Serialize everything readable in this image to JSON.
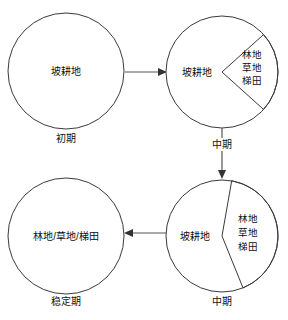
{
  "diagram": {
    "type": "process-cycle-pie-diagram",
    "nodes": [
      {
        "id": "initial",
        "caption": "初期",
        "center_label": "坡耕地",
        "wedge_label_lines": [],
        "slope_farmland_share": 100,
        "converted_share": 0
      },
      {
        "id": "middle-upper",
        "caption": "中期",
        "center_label": "坡耕地",
        "wedge_label_lines": [
          "林地",
          "草地",
          "梯田"
        ],
        "slope_farmland_share": 75,
        "converted_share": 25
      },
      {
        "id": "middle-lower",
        "caption": "中期",
        "center_label": "坡耕地",
        "wedge_label_lines": [
          "林地",
          "草地",
          "梯田"
        ],
        "slope_farmland_share": 60,
        "converted_share": 40
      },
      {
        "id": "stable",
        "caption": "稳定期",
        "center_label": "林地/草地/梯田",
        "wedge_label_lines": [],
        "slope_farmland_share": 0,
        "converted_share": 100
      }
    ],
    "arrows": [
      {
        "id": "arrow-initial-to-middle-upper",
        "direction": "right"
      },
      {
        "id": "arrow-middle-upper-to-middle-lower",
        "direction": "down",
        "label": "中期"
      },
      {
        "id": "arrow-middle-lower-to-stable",
        "direction": "left"
      }
    ],
    "colors": {
      "stroke": "#3a3a3a",
      "connector": "#555555",
      "text": "#101010",
      "background": "#ffffff"
    }
  }
}
